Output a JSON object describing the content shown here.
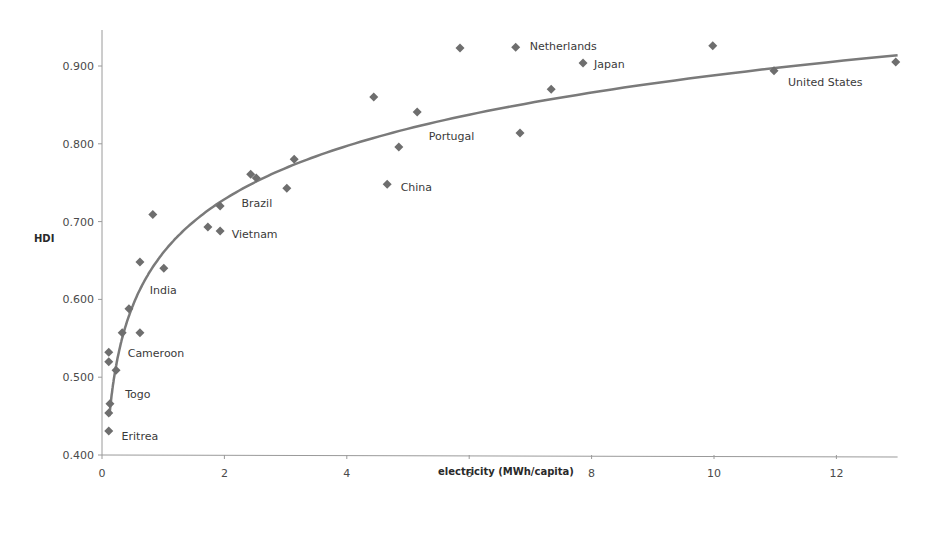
{
  "chart_data": {
    "type": "scatter",
    "title": "",
    "xlabel": "electricity  (MWh/capita)",
    "ylabel": "HDI",
    "xlim": [
      0,
      13
    ],
    "ylim": [
      0.4,
      0.95
    ],
    "xticks": [
      0,
      2,
      4,
      6,
      8,
      10,
      12
    ],
    "yticks": [
      "0.400",
      "0.500",
      "0.600",
      "0.700",
      "0.800",
      "0.900"
    ],
    "grid": false,
    "legend": null,
    "marker_color": "#6e6e6e",
    "trendline": {
      "type": "logarithmic",
      "a": 0.66,
      "b": 0.099,
      "x_range": [
        0.12,
        13
      ],
      "color": "#7a7a7a"
    },
    "points": [
      {
        "x": 0.11,
        "y": 0.532
      },
      {
        "x": 0.11,
        "y": 0.52
      },
      {
        "x": 0.23,
        "y": 0.509
      },
      {
        "x": 0.33,
        "y": 0.557
      },
      {
        "x": 0.44,
        "y": 0.588
      },
      {
        "x": 0.62,
        "y": 0.557
      },
      {
        "x": 0.13,
        "y": 0.466
      },
      {
        "x": 0.11,
        "y": 0.454
      },
      {
        "x": 0.11,
        "y": 0.431
      },
      {
        "x": 0.62,
        "y": 0.648
      },
      {
        "x": 1.01,
        "y": 0.64
      },
      {
        "x": 0.83,
        "y": 0.709
      },
      {
        "x": 1.73,
        "y": 0.693
      },
      {
        "x": 1.93,
        "y": 0.688
      },
      {
        "x": 1.93,
        "y": 0.72
      },
      {
        "x": 2.43,
        "y": 0.761
      },
      {
        "x": 2.52,
        "y": 0.756
      },
      {
        "x": 3.02,
        "y": 0.743
      },
      {
        "x": 3.14,
        "y": 0.78
      },
      {
        "x": 4.66,
        "y": 0.748
      },
      {
        "x": 4.85,
        "y": 0.796
      },
      {
        "x": 5.15,
        "y": 0.841
      },
      {
        "x": 4.44,
        "y": 0.86
      },
      {
        "x": 5.85,
        "y": 0.923
      },
      {
        "x": 6.76,
        "y": 0.924
      },
      {
        "x": 6.83,
        "y": 0.814
      },
      {
        "x": 7.34,
        "y": 0.87
      },
      {
        "x": 7.86,
        "y": 0.904
      },
      {
        "x": 9.98,
        "y": 0.926
      },
      {
        "x": 10.98,
        "y": 0.894
      },
      {
        "x": 12.97,
        "y": 0.905
      }
    ],
    "annotations": [
      {
        "text": "Eritrea",
        "x": 0.32,
        "y": 0.425
      },
      {
        "text": "Togo",
        "x": 0.38,
        "y": 0.478
      },
      {
        "text": "Cameroon",
        "x": 0.42,
        "y": 0.531
      },
      {
        "text": "India",
        "x": 0.78,
        "y": 0.612
      },
      {
        "text": "Vietnam",
        "x": 2.12,
        "y": 0.684
      },
      {
        "text": "Brazil",
        "x": 2.28,
        "y": 0.724
      },
      {
        "text": "China",
        "x": 4.88,
        "y": 0.744
      },
      {
        "text": "Portugal",
        "x": 5.34,
        "y": 0.81
      },
      {
        "text": "Netherlands",
        "x": 6.99,
        "y": 0.926
      },
      {
        "text": "Japan",
        "x": 8.04,
        "y": 0.902
      },
      {
        "text": "United States",
        "x": 11.21,
        "y": 0.88
      }
    ]
  }
}
